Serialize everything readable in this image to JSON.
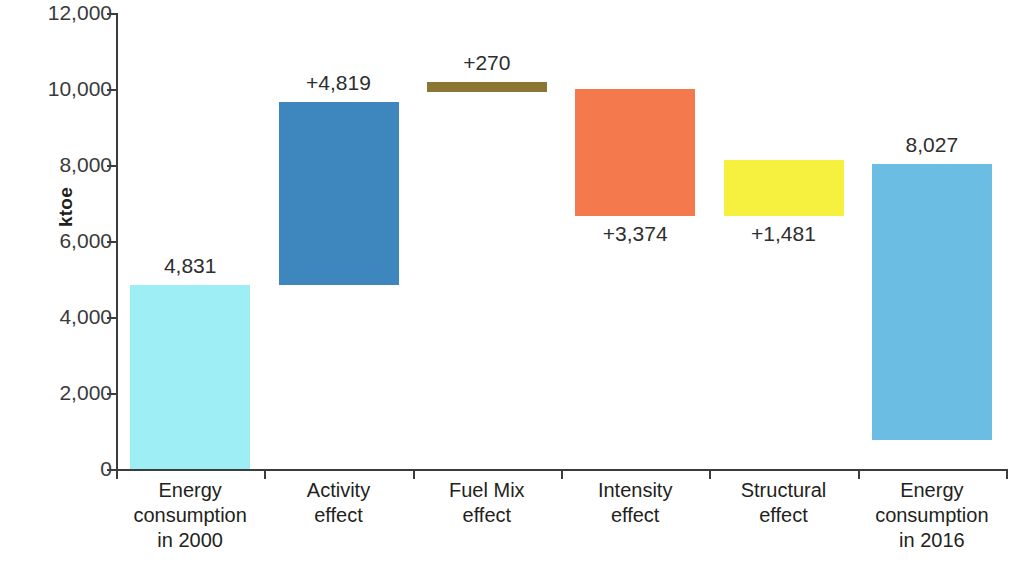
{
  "chart_data": {
    "type": "bar",
    "subtype": "waterfall",
    "title": "",
    "xlabel": "",
    "ylabel": "ktoe",
    "ylim": [
      0,
      12000
    ],
    "yticks": [
      0,
      2000,
      4000,
      6000,
      8000,
      10000,
      12000
    ],
    "ytick_labels": [
      "0",
      "2,000",
      "4,000",
      "6,000",
      "8,000",
      "10,000",
      "12,000"
    ],
    "grid": false,
    "legend": "none",
    "categories": [
      "Energy consumption in 2000",
      "Activity effect",
      "Fuel Mix effect",
      "Intensity effect",
      "Structural effect",
      "Energy consumption in 2016"
    ],
    "category_lines": [
      [
        "Energy",
        "consumption",
        "in 2000"
      ],
      [
        "Activity",
        "effect"
      ],
      [
        "Fuel Mix",
        "effect"
      ],
      [
        "Intensity",
        "effect"
      ],
      [
        "Structural",
        "effect"
      ],
      [
        "Energy",
        "consumption",
        "in 2016"
      ]
    ],
    "values": [
      4831,
      4819,
      270,
      3374,
      1481,
      8027
    ],
    "value_labels": [
      "4,831",
      "+4,819",
      "+270",
      "+3,374",
      "+1,481",
      "8,027"
    ],
    "bars": [
      {
        "name": "energy-consumption-2000",
        "label": "4,831",
        "value": 4831,
        "base": 0,
        "top": 4831,
        "color": "#9DEFF5",
        "kind": "total",
        "label_position": "above"
      },
      {
        "name": "activity-effect",
        "label": "+4,819",
        "value": 4819,
        "base": 4831,
        "top": 9650,
        "color": "#3E87BE",
        "kind": "increase",
        "label_position": "above"
      },
      {
        "name": "fuel-mix-effect",
        "label": "+270",
        "value": 270,
        "base": 9920,
        "top": 10190,
        "color": "#8A7734",
        "kind": "increase",
        "label_position": "above"
      },
      {
        "name": "intensity-effect",
        "label": "+3,374",
        "value": 3374,
        "base": 6650,
        "top": 10000,
        "color": "#F4794C",
        "kind": "increase",
        "label_position": "below"
      },
      {
        "name": "structural-effect",
        "label": "+1,481",
        "value": 1481,
        "base": 6650,
        "top": 8130,
        "color": "#F6F03E",
        "kind": "increase",
        "label_position": "below"
      },
      {
        "name": "energy-consumption-2016",
        "label": "8,027",
        "value": 8027,
        "base": 770,
        "top": 8027,
        "color": "#6BBDE3",
        "kind": "total",
        "label_position": "above"
      }
    ]
  },
  "axis": {
    "y_title": "ktoe",
    "tick_color": "#3c3c3c"
  }
}
